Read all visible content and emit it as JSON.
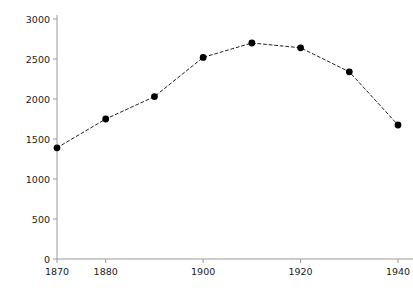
{
  "chart_data": {
    "type": "line",
    "title": "",
    "subtitle": "",
    "xlabel": "",
    "ylabel": "Number of Midwives in Public Employment",
    "x": [
      1870,
      1880,
      1890,
      1900,
      1910,
      1920,
      1930,
      1940
    ],
    "values": [
      1390,
      1750,
      2030,
      2520,
      2700,
      2640,
      2340,
      1675
    ],
    "series": [
      {
        "name": "Number of Midwives in Public Employment",
        "values": [
          1390,
          1750,
          2030,
          2520,
          2700,
          2640,
          2340,
          1675
        ]
      }
    ],
    "xlim": [
      1866,
      1944
    ],
    "ylim": [
      0,
      3000
    ],
    "xticks": [
      1870,
      1880,
      1900,
      1920,
      1940
    ],
    "xtick_labels": [
      "1870",
      "1880",
      "1900",
      "1920",
      "1940"
    ],
    "xticks_minor": [
      1890,
      1910,
      1930
    ],
    "yticks": [
      0,
      500,
      1000,
      1500,
      2000,
      2500,
      3000
    ],
    "ytick_labels": [
      "0",
      "500",
      "1000",
      "1500",
      "2000",
      "2500",
      "3000"
    ],
    "grid": false,
    "legend": false,
    "legend_position": "none",
    "line_style": "dashed",
    "marker": "circle",
    "marker_color": "#000000",
    "line_color": "#222222",
    "axis_color": "#9a9a9a",
    "background": "#ffffff"
  },
  "axes": {
    "y_axis_title": "Number of Midwives in Public Employment"
  }
}
